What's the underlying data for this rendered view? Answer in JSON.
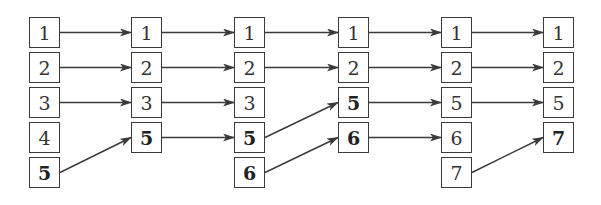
{
  "diagram": {
    "type": "array-update-sequence",
    "columns": [
      {
        "cells": [
          {
            "v": "1",
            "b": false
          },
          {
            "v": "2",
            "b": false
          },
          {
            "v": "3",
            "b": false
          },
          {
            "v": "4",
            "b": false
          },
          {
            "v": "5",
            "b": true
          }
        ]
      },
      {
        "cells": [
          {
            "v": "1",
            "b": false
          },
          {
            "v": "2",
            "b": false
          },
          {
            "v": "3",
            "b": false
          },
          {
            "v": "5",
            "b": true
          }
        ]
      },
      {
        "cells": [
          {
            "v": "1",
            "b": false
          },
          {
            "v": "2",
            "b": false
          },
          {
            "v": "3",
            "b": false
          },
          {
            "v": "5",
            "b": true
          },
          {
            "v": "6",
            "b": true
          }
        ]
      },
      {
        "cells": [
          {
            "v": "1",
            "b": false
          },
          {
            "v": "2",
            "b": false
          },
          {
            "v": "5",
            "b": true
          },
          {
            "v": "6",
            "b": true
          }
        ]
      },
      {
        "cells": [
          {
            "v": "1",
            "b": false
          },
          {
            "v": "2",
            "b": false
          },
          {
            "v": "5",
            "b": false
          },
          {
            "v": "6",
            "b": false
          },
          {
            "v": "7",
            "b": false
          }
        ]
      },
      {
        "cells": [
          {
            "v": "1",
            "b": false
          },
          {
            "v": "2",
            "b": false
          },
          {
            "v": "5",
            "b": false
          },
          {
            "v": "7",
            "b": true
          }
        ]
      }
    ],
    "arrows": [
      {
        "from": [
          0,
          0
        ],
        "to": [
          1,
          0
        ]
      },
      {
        "from": [
          0,
          1
        ],
        "to": [
          1,
          1
        ]
      },
      {
        "from": [
          0,
          2
        ],
        "to": [
          1,
          2
        ]
      },
      {
        "from": [
          0,
          4
        ],
        "to": [
          1,
          3
        ]
      },
      {
        "from": [
          1,
          0
        ],
        "to": [
          2,
          0
        ]
      },
      {
        "from": [
          1,
          1
        ],
        "to": [
          2,
          1
        ]
      },
      {
        "from": [
          1,
          2
        ],
        "to": [
          2,
          2
        ]
      },
      {
        "from": [
          1,
          3
        ],
        "to": [
          2,
          3
        ]
      },
      {
        "from": [
          2,
          0
        ],
        "to": [
          3,
          0
        ]
      },
      {
        "from": [
          2,
          1
        ],
        "to": [
          3,
          1
        ]
      },
      {
        "from": [
          2,
          3
        ],
        "to": [
          3,
          2
        ]
      },
      {
        "from": [
          2,
          4
        ],
        "to": [
          3,
          3
        ]
      },
      {
        "from": [
          3,
          0
        ],
        "to": [
          4,
          0
        ]
      },
      {
        "from": [
          3,
          1
        ],
        "to": [
          4,
          1
        ]
      },
      {
        "from": [
          3,
          2
        ],
        "to": [
          4,
          2
        ]
      },
      {
        "from": [
          3,
          3
        ],
        "to": [
          4,
          3
        ]
      },
      {
        "from": [
          4,
          0
        ],
        "to": [
          5,
          0
        ]
      },
      {
        "from": [
          4,
          1
        ],
        "to": [
          5,
          1
        ]
      },
      {
        "from": [
          4,
          2
        ],
        "to": [
          5,
          2
        ]
      },
      {
        "from": [
          4,
          4
        ],
        "to": [
          5,
          3
        ]
      }
    ],
    "colors": {
      "stroke": "#3a3a3a",
      "text": "#333333"
    }
  }
}
